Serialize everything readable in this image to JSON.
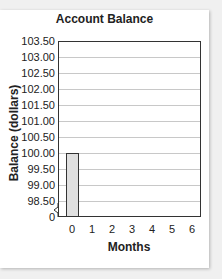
{
  "chart_data": {
    "type": "bar",
    "title": "Account Balance",
    "xlabel": "Months",
    "ylabel": "Balance (dollars)",
    "categories": [
      "0",
      "1",
      "2",
      "3",
      "4",
      "5",
      "6"
    ],
    "values": [
      100.0,
      null,
      null,
      null,
      null,
      null,
      null
    ],
    "ylim": [
      98.5,
      103.5
    ],
    "y_axis_break": true,
    "y_ticks": [
      "0",
      "98.50",
      "99.00",
      "99.50",
      "100.00",
      "100.50",
      "101.00",
      "101.50",
      "102.00",
      "102.50",
      "103.00",
      "103.50"
    ],
    "x_ticks": [
      "0",
      "1",
      "2",
      "3",
      "4",
      "5",
      "6"
    ],
    "grid": true,
    "bar_color": "#e0e0e0"
  }
}
